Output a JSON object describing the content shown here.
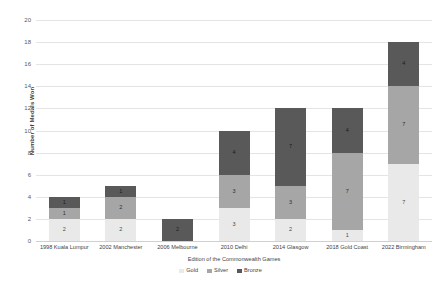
{
  "chart_data": {
    "type": "bar",
    "stacked": true,
    "title": "",
    "xlabel": "Edition of the Commonwealth Games",
    "ylabel": "Number of Medals Won",
    "ylim": [
      0,
      20
    ],
    "ytick_step": 2,
    "yticks": [
      "20",
      "18",
      "16",
      "14",
      "12",
      "10",
      "8",
      "6",
      "4",
      "2",
      "0"
    ],
    "grid": true,
    "legend_position": "bottom",
    "categories": [
      "1998 Kuala Lumpur",
      "2002 Manchester",
      "2006 Melbourne",
      "2010 Delhi",
      "2014 Glasgow",
      "2018 Gold Coast",
      "2022 Birmingham"
    ],
    "series": [
      {
        "name": "Gold",
        "color": "#e9e9e9",
        "values": [
          2,
          2,
          0,
          3,
          2,
          1,
          7
        ]
      },
      {
        "name": "Silver",
        "color": "#a6a6a6",
        "values": [
          1,
          2,
          0,
          3,
          3,
          7,
          7
        ]
      },
      {
        "name": "Bronze",
        "color": "#595959",
        "values": [
          1,
          1,
          2,
          4,
          7,
          4,
          4
        ]
      }
    ],
    "totals": [
      4,
      5,
      2,
      10,
      12,
      12,
      18
    ]
  },
  "legend": {
    "items": [
      {
        "label": "Gold",
        "color": "#e9e9e9"
      },
      {
        "label": "Silver",
        "color": "#a6a6a6"
      },
      {
        "label": "Bronze",
        "color": "#595959"
      }
    ]
  },
  "colors": {
    "gold": "#e9e9e9",
    "silver": "#a6a6a6",
    "bronze": "#595959",
    "gridline": "#e4e4e4",
    "text": "#3f3f3f",
    "background": "#ffffff"
  }
}
